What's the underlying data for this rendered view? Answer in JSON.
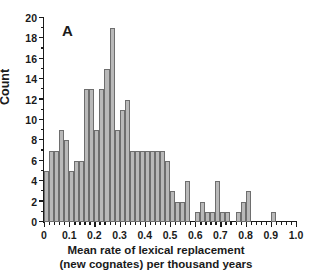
{
  "panel": {
    "label": "A"
  },
  "chart_data": {
    "type": "bar",
    "title": "",
    "panel_label": "A",
    "xlabel": "Mean rate of lexical replacement (new cognates) per thousand years",
    "xlabel_line1": "Mean rate of lexical replacement",
    "xlabel_line2": "(new cognates) per thousand years",
    "ylabel": "Count",
    "xlim": [
      0,
      1.0
    ],
    "ylim": [
      0,
      20
    ],
    "grid": false,
    "legend": null,
    "bin_width": 0.02,
    "bar_fill": "#b9b9b9",
    "bar_stroke": "#6e6e6e",
    "xticks": [
      0,
      0.1,
      0.2,
      0.3,
      0.4,
      0.5,
      0.6,
      0.7,
      0.8,
      0.9,
      1.0
    ],
    "xtick_labels": [
      "0",
      "0.1",
      "0.2",
      "0.3",
      "0.4",
      "0.5",
      "0.6",
      "0.7",
      "0.8",
      "0.9",
      "1.0"
    ],
    "xtick_minor_step": 0.02,
    "yticks": [
      0,
      2,
      4,
      6,
      8,
      10,
      12,
      14,
      16,
      18,
      20
    ],
    "ytick_labels": [
      "0",
      "2",
      "4",
      "6",
      "8",
      "10",
      "12",
      "14",
      "16",
      "18",
      "20"
    ],
    "ytick_minor_step": 1,
    "bin_starts": [
      0.0,
      0.02,
      0.04,
      0.06,
      0.08,
      0.1,
      0.12,
      0.14,
      0.16,
      0.18,
      0.2,
      0.22,
      0.24,
      0.26,
      0.28,
      0.3,
      0.32,
      0.34,
      0.36,
      0.38,
      0.4,
      0.42,
      0.44,
      0.46,
      0.48,
      0.5,
      0.52,
      0.54,
      0.56,
      0.58,
      0.6,
      0.62,
      0.64,
      0.66,
      0.68,
      0.7,
      0.72,
      0.74,
      0.76,
      0.78,
      0.8,
      0.82,
      0.84,
      0.86,
      0.88,
      0.9,
      0.92,
      0.94,
      0.96,
      0.98
    ],
    "values": [
      5,
      7,
      7,
      9,
      8,
      5,
      6,
      6,
      13,
      13,
      9,
      13,
      15,
      19,
      9,
      11,
      12,
      7,
      7,
      7,
      7,
      7,
      7,
      7,
      6,
      3,
      2,
      2,
      4,
      0,
      1,
      2,
      1,
      1,
      4,
      1,
      1,
      0,
      1,
      2,
      3,
      0,
      0,
      0,
      0,
      1,
      0,
      0,
      0,
      0
    ],
    "categories": [
      "0.00-0.02",
      "0.02-0.04",
      "0.04-0.06",
      "0.06-0.08",
      "0.08-0.10",
      "0.10-0.12",
      "0.12-0.14",
      "0.14-0.16",
      "0.16-0.18",
      "0.18-0.20",
      "0.20-0.22",
      "0.22-0.24",
      "0.24-0.26",
      "0.26-0.28",
      "0.28-0.30",
      "0.30-0.32",
      "0.32-0.34",
      "0.34-0.36",
      "0.36-0.38",
      "0.38-0.40",
      "0.40-0.42",
      "0.42-0.44",
      "0.44-0.46",
      "0.46-0.48",
      "0.48-0.50",
      "0.50-0.52",
      "0.52-0.54",
      "0.54-0.56",
      "0.56-0.58",
      "0.58-0.60",
      "0.60-0.62",
      "0.62-0.64",
      "0.64-0.66",
      "0.66-0.68",
      "0.68-0.70",
      "0.70-0.72",
      "0.72-0.74",
      "0.74-0.76",
      "0.76-0.78",
      "0.78-0.80",
      "0.80-0.82",
      "0.82-0.84",
      "0.84-0.86",
      "0.86-0.88",
      "0.88-0.90",
      "0.90-0.92",
      "0.92-0.94",
      "0.94-0.96",
      "0.96-0.98",
      "0.98-1.00"
    ]
  }
}
